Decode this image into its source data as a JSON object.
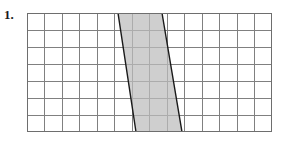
{
  "page": {
    "width": 284,
    "height": 144,
    "background_color": "#ffffff"
  },
  "problem": {
    "number_label": "1."
  },
  "figure": {
    "name": "parallelogram-on-grid",
    "grid": {
      "columns": 14,
      "rows": 7,
      "cell_size_px": 17.5,
      "origin_x_px": 27,
      "origin_y_px": 13,
      "width_px": 245,
      "height_px": 119,
      "line_color": "#808080",
      "border_color": "#6e6e6e",
      "cell_fill_color": "#ffffff",
      "grid_on": true
    },
    "shape": {
      "type": "parallelogram",
      "fill_color": "#bdbdbd",
      "stroke_color": "#1a1a1a",
      "stroke_width_px": 1.4,
      "vertices_px": [
        [
          91,
          0
        ],
        [
          135,
          0
        ],
        [
          155,
          119
        ],
        [
          109,
          119
        ]
      ],
      "vertices_grid_units": [
        [
          5.2,
          0
        ],
        [
          7.7,
          0
        ],
        [
          8.86,
          7
        ],
        [
          6.23,
          7
        ]
      ],
      "base_units": 2.5,
      "height_units": 7,
      "area_square_units": 17.5
    }
  }
}
